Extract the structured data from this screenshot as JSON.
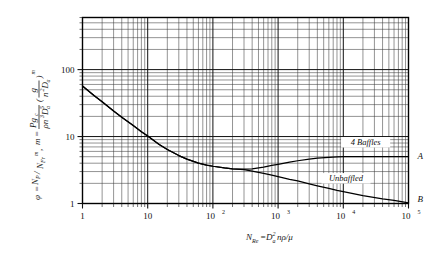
{
  "chart_data": {
    "type": "line",
    "title": "",
    "subtitle": "",
    "xlabel": "N_Re = D_a^2 n rho / mu",
    "xlabel_parts": {
      "n_symbol": "N",
      "n_sub": "Re",
      "equals": "=",
      "d_symbol": "D",
      "d_sub": "a",
      "d_sup": "2",
      "tail": "nρ/μ"
    },
    "ylabel": "phi = Np/(NFr)^m , m = Pgc/(rho n^3 Da^5) (g/(n^2 Da))^m",
    "ylabel_parts": {
      "phi": "φ",
      "eq1": "=",
      "np": "N",
      "np_sub": "P",
      "slash": "/",
      "nfr": "N",
      "nfr_sub": "Fr",
      "exp_m": "m",
      "comma": ",",
      "m_sym": "m",
      "eq2": "=",
      "num1": "Pg",
      "num1_sub": "c",
      "den1": "ρn",
      "den1_sup": "3",
      "den1b": "D",
      "den1b_sub": "a",
      "den1b_sup": "5",
      "num2": "g",
      "den2": "n",
      "den2_sup": "2",
      "den2b": "D",
      "den2b_sub": "a",
      "outer_exp": "m"
    },
    "xscale": "log",
    "yscale": "log",
    "xlim": [
      1,
      100000
    ],
    "ylim": [
      1,
      600
    ],
    "grid": true,
    "minor_grid": true,
    "legend_position": "inline-annotations",
    "xticks": [
      {
        "value": 1,
        "label": "1",
        "sup": ""
      },
      {
        "value": 10,
        "label": "10",
        "sup": ""
      },
      {
        "value": 100,
        "label": "10",
        "sup": "2"
      },
      {
        "value": 1000,
        "label": "10",
        "sup": "3"
      },
      {
        "value": 10000,
        "label": "10",
        "sup": "4"
      },
      {
        "value": 100000,
        "label": "10",
        "sup": "5"
      }
    ],
    "yticks": [
      {
        "value": 1,
        "label": "1"
      },
      {
        "value": 10,
        "label": "10"
      },
      {
        "value": 100,
        "label": "100"
      }
    ],
    "annotations": [
      {
        "name": "baffled-curve-label",
        "text": "4 Baffles",
        "x": 22000,
        "y": 7.6
      },
      {
        "name": "unbaffled-curve-label",
        "text": "Unbaffled",
        "x": 11000,
        "y": 2.2
      },
      {
        "name": "curve-a-endpoint-label",
        "text": "A",
        "x": 120000,
        "y": 4.6
      },
      {
        "name": "curve-b-endpoint-label",
        "text": "B",
        "x": 120000,
        "y": 1.05
      }
    ],
    "series": [
      {
        "name": "4 Baffles",
        "end_label": "A",
        "points": [
          [
            1,
            57
          ],
          [
            1.5,
            41
          ],
          [
            2,
            33
          ],
          [
            3,
            24
          ],
          [
            4,
            19.5
          ],
          [
            6,
            14.6
          ],
          [
            8,
            11.8
          ],
          [
            10,
            10.2
          ],
          [
            15,
            7.6
          ],
          [
            20,
            6.4
          ],
          [
            30,
            5.2
          ],
          [
            40,
            4.6
          ],
          [
            60,
            4.0
          ],
          [
            80,
            3.75
          ],
          [
            100,
            3.6
          ],
          [
            150,
            3.4
          ],
          [
            200,
            3.3
          ],
          [
            300,
            3.25
          ],
          [
            400,
            3.3
          ],
          [
            600,
            3.5
          ],
          [
            800,
            3.7
          ],
          [
            1000,
            3.85
          ],
          [
            1500,
            4.15
          ],
          [
            2000,
            4.35
          ],
          [
            3000,
            4.6
          ],
          [
            4000,
            4.75
          ],
          [
            6000,
            4.9
          ],
          [
            8000,
            4.97
          ],
          [
            10000,
            5.0
          ],
          [
            20000,
            5.0
          ],
          [
            40000,
            5.0
          ],
          [
            100000,
            5.0
          ]
        ]
      },
      {
        "name": "Unbaffled",
        "end_label": "B",
        "points": [
          [
            1,
            57
          ],
          [
            1.5,
            41
          ],
          [
            2,
            33
          ],
          [
            3,
            24
          ],
          [
            4,
            19.5
          ],
          [
            6,
            14.6
          ],
          [
            8,
            11.8
          ],
          [
            10,
            10.2
          ],
          [
            15,
            7.6
          ],
          [
            20,
            6.4
          ],
          [
            30,
            5.2
          ],
          [
            40,
            4.6
          ],
          [
            60,
            4.0
          ],
          [
            80,
            3.75
          ],
          [
            100,
            3.6
          ],
          [
            150,
            3.4
          ],
          [
            200,
            3.3
          ],
          [
            300,
            3.2
          ],
          [
            400,
            3.05
          ],
          [
            600,
            2.82
          ],
          [
            800,
            2.65
          ],
          [
            1000,
            2.52
          ],
          [
            1500,
            2.3
          ],
          [
            2000,
            2.17
          ],
          [
            3000,
            1.97
          ],
          [
            4000,
            1.84
          ],
          [
            6000,
            1.68
          ],
          [
            8000,
            1.57
          ],
          [
            10000,
            1.5
          ],
          [
            20000,
            1.31
          ],
          [
            40000,
            1.17
          ],
          [
            60000,
            1.11
          ],
          [
            100000,
            1.02
          ]
        ]
      }
    ]
  }
}
